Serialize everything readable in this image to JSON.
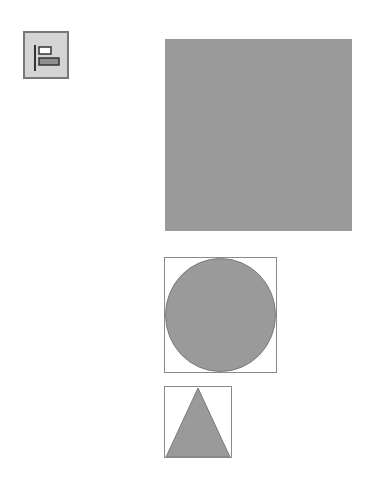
{
  "toolbar": {
    "align_button": {
      "icon": "align-left-icon",
      "tooltip": ""
    }
  },
  "canvas": {
    "shapes": [
      {
        "type": "square",
        "fill": "#9a9a9a",
        "selected": false
      },
      {
        "type": "circle",
        "fill": "#9a9a9a",
        "selected": true
      },
      {
        "type": "triangle",
        "fill": "#9a9a9a",
        "selected": true
      }
    ]
  },
  "colors": {
    "shape_fill": "#9a9a9a",
    "shape_stroke": "#7a7a7a",
    "selection_box": "#8a8a8a",
    "button_bg": "#d4d4d4"
  }
}
